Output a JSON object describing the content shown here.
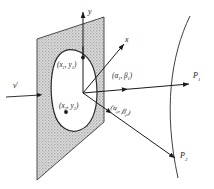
{
  "figure": {
    "type": "scientific-diagram",
    "background_color": "#ffffff",
    "ink_color": "#1a1a1a",
    "plane_fill_color": "#d9d9d9"
  },
  "axes": {
    "y_label": "y",
    "x_label": "x"
  },
  "incident": {
    "label_v": "v",
    "label_i": "i"
  },
  "aperture_points": [
    {
      "id": "p1",
      "label_open": "(",
      "x_sym": "x",
      "x_sub": "1",
      "comma": ", ",
      "y_sym": "y",
      "y_sub": "1",
      "label_close": ")"
    },
    {
      "id": "p2",
      "label_open": "(",
      "x_sym": "x",
      "x_sub": "2",
      "comma": ", ",
      "y_sym": "y",
      "y_sub": "2",
      "label_close": ")"
    }
  ],
  "rays": [
    {
      "id": "ray1",
      "direction_open": "(",
      "alpha": "α",
      "alpha_sub": "1",
      "comma": ", ",
      "beta": "β",
      "beta_sub": "1",
      "direction_close": ")",
      "endpoint": "P",
      "endpoint_sub": "1"
    },
    {
      "id": "ray2",
      "direction_open": "(",
      "alpha": "α",
      "alpha_sub": "2",
      "comma": ", ",
      "beta": "β",
      "beta_sub": "2",
      "direction_close": ")",
      "endpoint": "P",
      "endpoint_sub": "2"
    }
  ],
  "arc": {
    "name": "observation-sphere-arc"
  }
}
